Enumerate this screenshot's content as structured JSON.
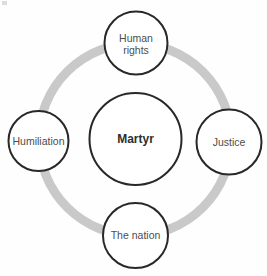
{
  "diagram": {
    "center": {
      "label": "Martyr"
    },
    "nodes": [
      {
        "id": "human-rights",
        "position": "top",
        "label": "Human rights",
        "lines": [
          "Human",
          "rights"
        ]
      },
      {
        "id": "justice",
        "position": "right",
        "label": "Justice",
        "lines": [
          "Justice"
        ]
      },
      {
        "id": "the-nation",
        "position": "bottom",
        "label": "The nation",
        "lines": [
          "The nation"
        ]
      },
      {
        "id": "humiliation",
        "position": "left",
        "label": "Humiliation",
        "lines": [
          "Humiliation"
        ]
      }
    ],
    "colors": {
      "background": "#fefefe",
      "ring": "#c9c9c9",
      "circle_stroke": "#282828",
      "circle_fill": "#ffffff",
      "label_text": "#4d4d4d",
      "center_text": "#2e2e2e"
    }
  }
}
